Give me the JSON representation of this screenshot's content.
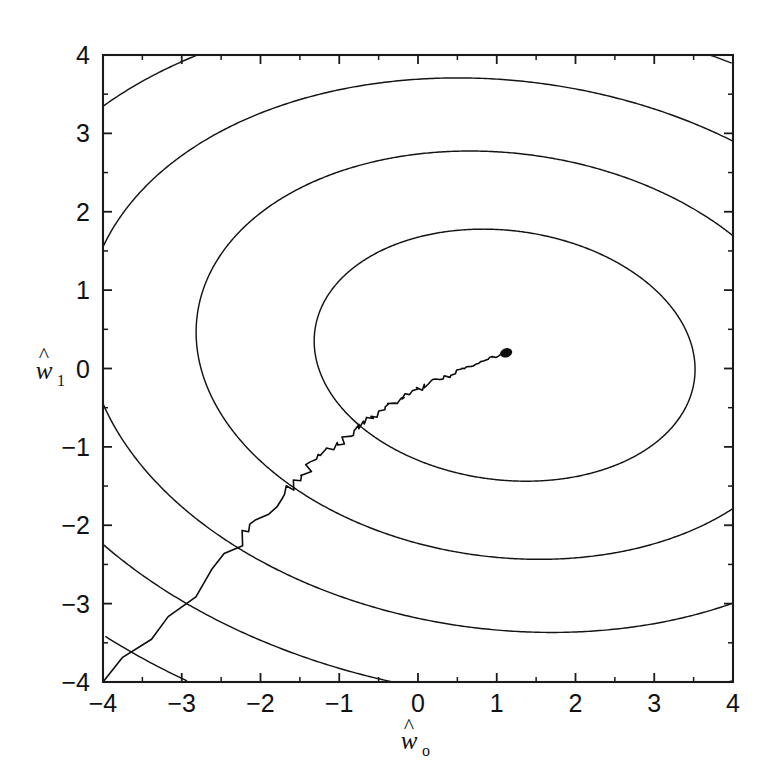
{
  "figure": {
    "background_color": "#ffffff",
    "ink_color": "#111111",
    "plot_box": {
      "left": 103,
      "top": 55,
      "right": 733,
      "bottom": 682
    }
  },
  "chart_data": {
    "type": "line",
    "title": "",
    "subtitle": "",
    "xlabel": "ŵ₀",
    "xlabel_base": "w",
    "xlabel_sub": "o",
    "ylabel": "ŵ₁",
    "ylabel_base": "w",
    "ylabel_sub": "1",
    "xlim": [
      -4,
      4
    ],
    "ylim": [
      -4,
      4
    ],
    "xticks": [
      -4,
      -3,
      -2,
      -1,
      0,
      1,
      2,
      3,
      4
    ],
    "xtick_labels": [
      "-4",
      "-3",
      "-2",
      "-1",
      "0",
      "1",
      "2",
      "3",
      "4"
    ],
    "yticks": [
      -4,
      -3,
      -2,
      -1,
      0,
      1,
      2,
      3,
      4
    ],
    "ytick_labels": [
      "-4",
      "-3",
      "-2",
      "-1",
      "0",
      "1",
      "2",
      "3",
      "4"
    ],
    "minor_tick_interval": 0.5,
    "grid": false,
    "legend": false,
    "legend_position": "none",
    "box_frame": true,
    "overlays": [
      {
        "name": "error-surface-contours",
        "kind": "contour",
        "center": [
          1.1,
          0.17
        ],
        "semi_major": 2.43,
        "semi_minor": 1.59,
        "rotation_deg": -7.5,
        "n_levels": 9,
        "level_scales": [
          1.0,
          1.62,
          2.2,
          2.74,
          3.25,
          3.72,
          4.17,
          4.6,
          5.02
        ],
        "line_color": "#141414",
        "line_width": 1.45
      },
      {
        "name": "lms-descent-trajectory",
        "kind": "noisy-polyline",
        "start": [
          -4.0,
          -4.0
        ],
        "end": [
          1.12,
          0.2
        ],
        "line_color": "#0b0b0b",
        "line_width": 1.6,
        "description": "stochastic gradient descent weight track",
        "vertices": [
          [
            -4.0,
            -4.0
          ],
          [
            -3.72,
            -3.71
          ],
          [
            -3.44,
            -3.42
          ],
          [
            -3.16,
            -3.14
          ],
          [
            -2.88,
            -2.86
          ],
          [
            -2.62,
            -2.6
          ],
          [
            -2.42,
            -2.42
          ],
          [
            -2.22,
            -2.2
          ],
          [
            -2.2,
            -2.12
          ],
          [
            -2.14,
            -2.1
          ],
          [
            -2.1,
            -2.04
          ],
          [
            -2.0,
            -1.93
          ],
          [
            -1.9,
            -1.82
          ],
          [
            -1.82,
            -1.73
          ],
          [
            -1.76,
            -1.66
          ],
          [
            -1.7,
            -1.6
          ],
          [
            -1.68,
            -1.52
          ],
          [
            -1.63,
            -1.5
          ],
          [
            -1.6,
            -1.46
          ],
          [
            -1.54,
            -1.43
          ],
          [
            -1.52,
            -1.37
          ],
          [
            -1.47,
            -1.35
          ],
          [
            -1.44,
            -1.3
          ],
          [
            -1.4,
            -1.28
          ],
          [
            -1.38,
            -1.22
          ],
          [
            -1.34,
            -1.2
          ],
          [
            -1.3,
            -1.16
          ],
          [
            -1.24,
            -1.13
          ],
          [
            -1.2,
            -1.07
          ],
          [
            -1.16,
            -1.06
          ],
          [
            -1.12,
            -1.0
          ],
          [
            -1.07,
            -0.99
          ],
          [
            -1.05,
            -0.95
          ],
          [
            -1.0,
            -0.93
          ],
          [
            -0.96,
            -0.92
          ],
          [
            -0.92,
            -0.86
          ],
          [
            -0.88,
            -0.85
          ],
          [
            -0.85,
            -0.81
          ],
          [
            -0.8,
            -0.79
          ],
          [
            -0.77,
            -0.75
          ],
          [
            -0.73,
            -0.74
          ],
          [
            -0.7,
            -0.7
          ],
          [
            -0.66,
            -0.69
          ],
          [
            -0.63,
            -0.65
          ],
          [
            -0.6,
            -0.64
          ],
          [
            -0.56,
            -0.6
          ],
          [
            -0.52,
            -0.59
          ],
          [
            -0.5,
            -0.55
          ],
          [
            -0.45,
            -0.54
          ],
          [
            -0.42,
            -0.5
          ],
          [
            -0.38,
            -0.49
          ],
          [
            -0.35,
            -0.46
          ],
          [
            -0.31,
            -0.45
          ],
          [
            -0.28,
            -0.42
          ],
          [
            -0.24,
            -0.41
          ],
          [
            -0.21,
            -0.38
          ],
          [
            -0.17,
            -0.37
          ],
          [
            -0.14,
            -0.34
          ],
          [
            -0.1,
            -0.33
          ],
          [
            -0.07,
            -0.3
          ],
          [
            -0.03,
            -0.29
          ],
          [
            0.0,
            -0.27
          ],
          [
            0.04,
            -0.26
          ],
          [
            0.07,
            -0.23
          ],
          [
            0.11,
            -0.22
          ],
          [
            0.14,
            -0.2
          ],
          [
            0.18,
            -0.19
          ],
          [
            0.21,
            -0.16
          ],
          [
            0.25,
            -0.15
          ],
          [
            0.28,
            -0.13
          ],
          [
            0.32,
            -0.12
          ],
          [
            0.35,
            -0.1
          ],
          [
            0.39,
            -0.09
          ],
          [
            0.42,
            -0.07
          ],
          [
            0.46,
            -0.06
          ],
          [
            0.49,
            -0.04
          ],
          [
            0.53,
            -0.03
          ],
          [
            0.56,
            -0.01
          ],
          [
            0.6,
            0.0
          ],
          [
            0.63,
            0.02
          ],
          [
            0.67,
            0.03
          ],
          [
            0.7,
            0.05
          ],
          [
            0.74,
            0.06
          ],
          [
            0.77,
            0.08
          ],
          [
            0.81,
            0.09
          ],
          [
            0.84,
            0.1
          ],
          [
            0.88,
            0.11
          ],
          [
            0.91,
            0.13
          ],
          [
            0.95,
            0.14
          ],
          [
            0.98,
            0.15
          ],
          [
            1.01,
            0.16
          ],
          [
            1.04,
            0.17
          ],
          [
            1.07,
            0.18
          ],
          [
            1.1,
            0.19
          ],
          [
            1.12,
            0.2
          ]
        ]
      }
    ]
  }
}
